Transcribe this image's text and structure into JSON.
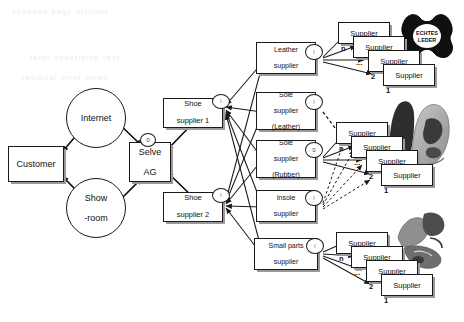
{
  "diagram": {
    "colors": {
      "line": "#1a1a1a",
      "box_fill": "#ffffff",
      "shadow": "#9a9a9a",
      "ghost_text": "#ebebeb"
    },
    "customer_side": {
      "customer": {
        "label": "Customer"
      },
      "internet": {
        "label": "Internet"
      },
      "showroom": {
        "label": "Show\n-room"
      },
      "showroom_line1": "Show",
      "showroom_line2": "-room"
    },
    "focal": {
      "label_line1": "Selve",
      "label_line2": "AG",
      "badge": "D"
    },
    "tier1": [
      {
        "label_line1": "Shoe",
        "label_line2": "supplier 1",
        "badge": "I"
      },
      {
        "label_line1": "Shoe",
        "label_line2": "supplier 2",
        "badge": "I"
      }
    ],
    "tier2": [
      {
        "label_line1": "Leather",
        "label_line2": "supplier",
        "label_line3": "",
        "badge": "I"
      },
      {
        "label_line1": "Sole",
        "label_line2": "supplier",
        "label_line3": "(Leather)",
        "badge": "I"
      },
      {
        "label_line1": "Sole",
        "label_line2": "supplier",
        "label_line3": "(Rubber)",
        "badge": "D"
      },
      {
        "label_line1": "Insole",
        "label_line2": "supplier",
        "label_line3": "",
        "badge": "I"
      },
      {
        "label_line1": "Small parts",
        "label_line2": "supplier",
        "label_line3": "",
        "badge": "I"
      }
    ],
    "stacks": [
      {
        "name": "leather-supplier-stack",
        "cards": [
          {
            "label": "Supplier",
            "index": "n"
          },
          {
            "label": "Supplier",
            "index": "..."
          },
          {
            "label": "Supplier",
            "index": "2"
          },
          {
            "label": "Supplier",
            "index": "1"
          }
        ]
      },
      {
        "name": "sole-supplier-stack",
        "cards": [
          {
            "label": "Supplier",
            "index": "n"
          },
          {
            "label": "Supplier",
            "index": "..."
          },
          {
            "label": "Supplier",
            "index": "2"
          },
          {
            "label": "Supplier",
            "index": "1"
          }
        ]
      },
      {
        "name": "small-parts-supplier-stack",
        "cards": [
          {
            "label": "Supplier",
            "index": "n"
          },
          {
            "label": "Supplier",
            "index": "..."
          },
          {
            "label": "Supplier",
            "index": "2"
          },
          {
            "label": "Supplier",
            "index": "1"
          }
        ]
      }
    ],
    "imagery": {
      "leather_mark_line1": "ECHTES",
      "leather_mark_line2": "LEDER",
      "shoe_photo_alt": "grey leather shoe photograph",
      "parts_photo_alt": "shoe components photograph"
    },
    "background_ghost_text": [
      "scanned page artifact",
      "faint underlying text",
      "residual print bleed"
    ]
  }
}
